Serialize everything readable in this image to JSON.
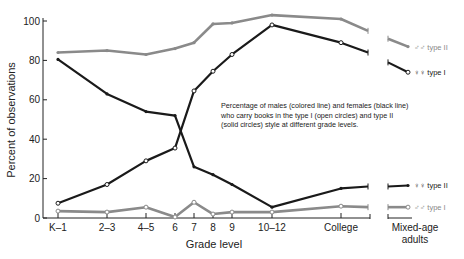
{
  "chart_data": {
    "type": "line",
    "title": "",
    "xlabel": "Grade level",
    "ylabel": "Percent of observations",
    "ylim": [
      0,
      100
    ],
    "yticks": [
      0,
      20,
      40,
      60,
      80,
      100
    ],
    "categories": [
      "K-1",
      "2-3",
      "4-5",
      "6",
      "7",
      "8",
      "9",
      "10-12",
      "College"
    ],
    "adult_category": [
      "Mixed-age",
      "adults"
    ],
    "grid": false,
    "annotation": [
      "Percentage of males (colored line) and females (black line)",
      "who carry books in the type I (open circles) and type II",
      "(solid circles) style at different grade levels."
    ],
    "series": [
      {
        "name": "♂♂ type II",
        "sex": "male",
        "style": "type II",
        "color": "#8a8a8a",
        "marker": "solid",
        "values": [
          84,
          85,
          83,
          86,
          89,
          98.5,
          99,
          103,
          101
        ],
        "college_end": 95,
        "adults": [
          91,
          87
        ]
      },
      {
        "name": "♀♀ type I",
        "sex": "female",
        "style": "type I",
        "color": "#1a1a1a",
        "marker": "open",
        "values": [
          7.5,
          17,
          29,
          35.5,
          64.5,
          74.5,
          83,
          98,
          89
        ],
        "college_end": 84,
        "adults": [
          79,
          74
        ]
      },
      {
        "name": "♀♀ type II",
        "sex": "female",
        "style": "type II",
        "color": "#1a1a1a",
        "marker": "solid",
        "values": [
          80.5,
          63,
          54,
          52,
          26,
          22,
          17,
          5.5,
          15
        ],
        "college_end": 16,
        "adults": [
          16,
          16.5
        ]
      },
      {
        "name": "♂♂ type I",
        "sex": "male",
        "style": "type I",
        "color": "#8a8a8a",
        "marker": "open",
        "values": [
          3.5,
          3,
          5.5,
          0.5,
          8,
          2,
          3,
          3,
          6
        ],
        "college_end": 5.5,
        "adults": [
          5.5,
          5.5
        ]
      }
    ]
  }
}
